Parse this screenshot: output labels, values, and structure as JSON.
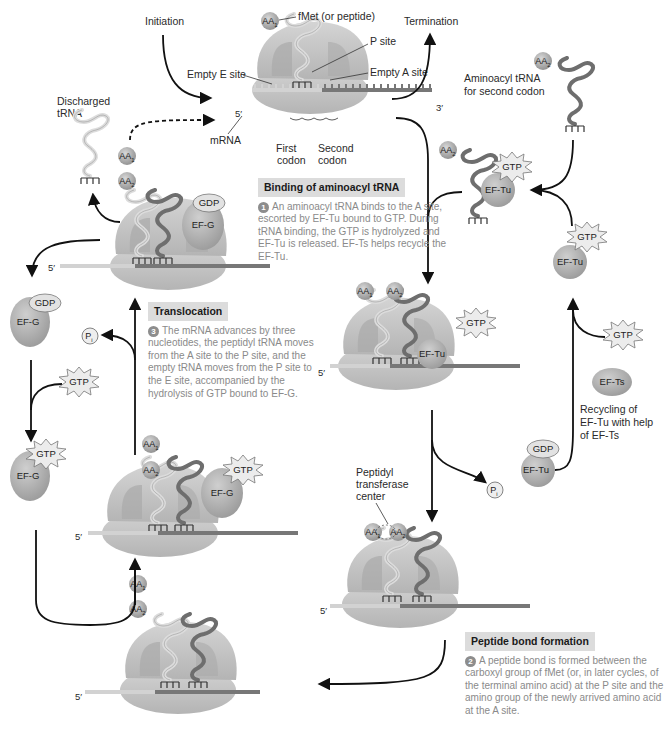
{
  "labels": {
    "initiation": "Initiation",
    "termination": "Termination",
    "fmet": "fMet (or peptide)",
    "p_site": "P site",
    "empty_e_site": "Empty E site",
    "empty_a_site": "Empty A site",
    "mrna": "mRNA",
    "first_codon_1": "First",
    "first_codon_2": "codon",
    "second_codon_1": "Second",
    "second_codon_2": "codon",
    "five_prime": "5′",
    "three_prime": "3′",
    "discharged_1": "Discharged",
    "discharged_2": "tRNA",
    "aminoacyl_1": "Aminoacyl tRNA",
    "aminoacyl_2": "for second codon",
    "peptidyl_1": "Peptidyl",
    "peptidyl_2": "transferase",
    "peptidyl_3": "center",
    "recycling_1": "Recycling of",
    "recycling_2": "EF-Tu with help",
    "recycling_3": "of EF-Ts"
  },
  "molecules": {
    "gtp": "GTP",
    "gdp": "GDP",
    "ef_tu": "EF-Tu",
    "ef_ts": "EF-Ts",
    "ef_g": "EF-G",
    "pi": "P",
    "pi_sub": "i",
    "aa": "AA",
    "aa1_sub": "1",
    "aa2_sub": "2"
  },
  "steps": [
    {
      "number": "1",
      "title": "Binding of aminoacyl tRNA",
      "text": "An aminoacyl tRNA binds to the A site, escorted by EF-Tu bound to GTP. During tRNA binding, the GTP is hydrolyzed and EF-Tu is released. EF-Ts helps recycle the EF-Tu."
    },
    {
      "number": "2",
      "title": "Peptide bond formation",
      "text": "A peptide bond is formed between the carboxyl group of fMet (or, in later cycles, of the terminal amino acid) at the P site and the amino group of the newly arrived amino acid at the A site."
    },
    {
      "number": "3",
      "title": "Translocation",
      "text": "The mRNA advances by three nucleotides, the peptidyl tRNA moves from the A site to the P site, and the empty tRNA moves from the P site to the E site, accompanied by the hydrolysis of GTP bound to EF-G."
    }
  ],
  "colors": {
    "ribosome": "#c4c4c4",
    "ribosome_dark": "#a9a9a9",
    "mrna_light": "#d2d2d2",
    "mrna_dark": "#777777",
    "trna_light": "#d9d9d9",
    "trna_dark": "#6e6e6e",
    "factor": "#a6a6a6",
    "title_box": "#dcdcdc",
    "body_text": "#8a8a8a"
  }
}
